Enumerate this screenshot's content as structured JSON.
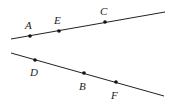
{
  "diagram": {
    "lines": [
      {
        "name": "upper-line",
        "x1": 11,
        "y1": 39,
        "x2": 165,
        "y2": 12
      },
      {
        "name": "lower-line",
        "x1": 11,
        "y1": 53,
        "x2": 164,
        "y2": 96
      }
    ],
    "points": [
      {
        "label": "A",
        "x": 30,
        "y": 36,
        "lx": 25,
        "ly": 29
      },
      {
        "label": "E",
        "x": 59,
        "y": 31,
        "lx": 54,
        "ly": 24
      },
      {
        "label": "C",
        "x": 105,
        "y": 22,
        "lx": 100,
        "ly": 15
      },
      {
        "label": "D",
        "x": 35,
        "y": 60,
        "lx": 30,
        "ly": 76
      },
      {
        "label": "B",
        "x": 84,
        "y": 73,
        "lx": 79,
        "ly": 90
      },
      {
        "label": "F",
        "x": 116,
        "y": 82,
        "lx": 111,
        "ly": 99
      }
    ],
    "colors": {
      "line": "#222222",
      "point": "#111111"
    }
  }
}
